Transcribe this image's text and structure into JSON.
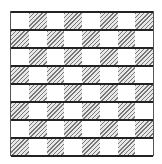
{
  "diagram": {
    "type": "hatched-checkerboard",
    "rows": 8,
    "cols": 8,
    "first_row_starts_with": "white",
    "colors": {
      "line": "#222222",
      "hatch": "#777777",
      "background": "#ffffff"
    }
  }
}
